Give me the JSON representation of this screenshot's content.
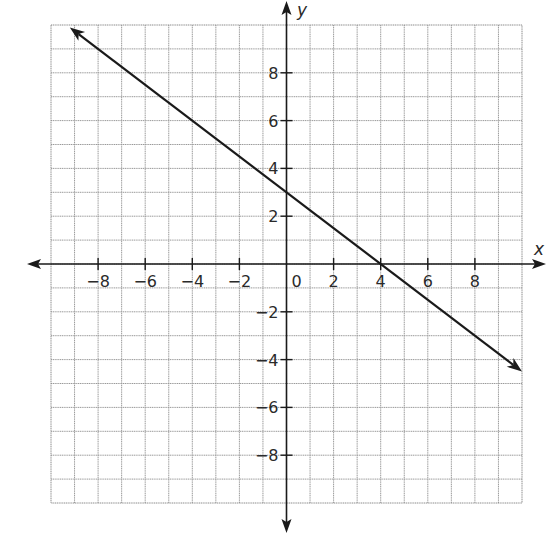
{
  "chart_data": {
    "type": "line",
    "title": "",
    "xlabel": "x",
    "ylabel": "y",
    "xlim": [
      -10,
      10
    ],
    "ylim": [
      -10,
      10
    ],
    "grid": true,
    "grid_step": 1,
    "x_ticks": [
      -8,
      -6,
      -4,
      -2,
      0,
      2,
      4,
      6,
      8
    ],
    "y_ticks": [
      -8,
      -6,
      -4,
      -2,
      2,
      4,
      6,
      8
    ],
    "x_tick_labels": [
      "−8",
      "−6",
      "−4",
      "−2",
      "0",
      "2",
      "4",
      "6",
      "8"
    ],
    "y_tick_labels": [
      "−8",
      "−6",
      "−4",
      "−2",
      "2",
      "4",
      "6",
      "8"
    ],
    "origin_label": "0",
    "legend": null,
    "series": [
      {
        "name": "line",
        "equation": "y = -0.75x + 3",
        "slope": -0.75,
        "y_intercept": 3,
        "x_intercept": 4,
        "x": [
          -9.2,
          -4,
          0,
          4,
          8,
          10
        ],
        "y": [
          9.9,
          6,
          3,
          0,
          -3,
          -4.5
        ],
        "arrows_both_ends": true,
        "color": "#1a1a1a"
      }
    ]
  },
  "axes": {
    "x_title": "x",
    "y_title": "y"
  },
  "layout": {
    "grid_left_px": 51,
    "grid_top_px": 25,
    "grid_right_px": 522,
    "grid_bottom_px": 503
  }
}
